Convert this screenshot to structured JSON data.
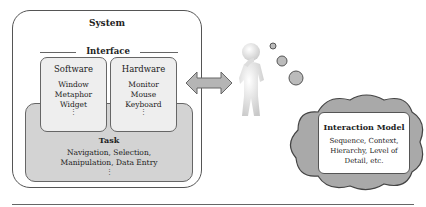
{
  "system": {
    "title": "System"
  },
  "interface": {
    "title": "Interface"
  },
  "software": {
    "title": "Software",
    "items": [
      "Window",
      "Metaphor",
      "Widget"
    ],
    "more": "⋮"
  },
  "hardware": {
    "title": "Hardware",
    "items": [
      "Monitor",
      "Mouse",
      "Keyboard"
    ],
    "more": "⋮"
  },
  "task": {
    "title": "Task",
    "lines": [
      "Navigation, Selection,",
      "Manipulation, Data Entry"
    ],
    "more": "⋮"
  },
  "interaction_model": {
    "title": "Interaction Model",
    "lines": [
      "Sequence, Context,",
      "Hierarchy, Level of",
      "Detail, etc."
    ]
  },
  "icons": {
    "arrow": "double-headed-arrow",
    "user": "thinking-person",
    "thought": "thought-cloud"
  },
  "colors": {
    "task_fill": "#d3d3d3",
    "panel_fill": "#eeeeee",
    "cloud_fill": "#a9a9a9",
    "arrow_fill": "#b5b5b5"
  }
}
